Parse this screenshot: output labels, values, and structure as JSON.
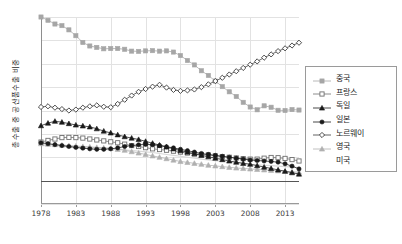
{
  "chart_data": {
    "type": "line",
    "title": "",
    "xlabel": "",
    "ylabel": "총수출 중 공산품수출 비중",
    "ylim": [
      -10,
      70
    ],
    "xlim": [
      1978,
      2015
    ],
    "ytick_labels": [
      "70%",
      "60%",
      "50%",
      "40%",
      "30%",
      "20%",
      "10%",
      "0%",
      "-10%"
    ],
    "ytick_values": [
      70,
      60,
      50,
      40,
      30,
      20,
      10,
      0,
      -10
    ],
    "xtick_labels": [
      "1978",
      "1983",
      "1988",
      "1993",
      "1998",
      "2003",
      "2008",
      "2013"
    ],
    "xtick_values": [
      1978,
      1983,
      1988,
      1993,
      1998,
      2003,
      2008,
      2013
    ],
    "grid": true,
    "legend_position": "right",
    "x": [
      1978,
      1979,
      1980,
      1981,
      1982,
      1983,
      1984,
      1985,
      1986,
      1987,
      1988,
      1989,
      1990,
      1991,
      1992,
      1993,
      1994,
      1995,
      1996,
      1997,
      1998,
      1999,
      2000,
      2001,
      2002,
      2003,
      2004,
      2005,
      2006,
      2007,
      2008,
      2009,
      2010,
      2011,
      2012,
      2013,
      2014,
      2015
    ],
    "series": [
      {
        "name": "중국",
        "marker": "filled-square",
        "color": "#a6a6a6",
        "values": [
          70.0,
          68.6,
          67.0,
          66.3,
          64.5,
          62.0,
          59.1,
          57.6,
          57.0,
          56.4,
          56.5,
          56.5,
          56.2,
          55.4,
          55.3,
          55.5,
          55.6,
          55.4,
          55.5,
          55.0,
          53.5,
          51.4,
          49.5,
          47.0,
          45.0,
          42.6,
          40.2,
          38.0,
          36.0,
          33.5,
          31.5,
          30.3,
          32.0,
          31.4,
          30.1,
          30.0,
          30.4,
          30.2
        ]
      },
      {
        "name": "프랑스",
        "marker": "open-square",
        "color": "#6e6e6e",
        "values": [
          16.5,
          17.2,
          17.8,
          18.4,
          18.5,
          18.4,
          18.2,
          17.8,
          17.4,
          17.0,
          16.6,
          16.2,
          15.6,
          15.0,
          14.6,
          14.1,
          13.6,
          13.3,
          13.0,
          12.6,
          12.2,
          11.8,
          11.4,
          11.2,
          11.0,
          10.6,
          10.3,
          10.0,
          9.7,
          9.4,
          9.2,
          9.2,
          9.6,
          9.9,
          9.8,
          9.5,
          9.0,
          8.4
        ]
      },
      {
        "name": "독일",
        "marker": "filled-triangle",
        "color": "#1a1a1a",
        "values": [
          23.5,
          24.6,
          25.4,
          25.0,
          24.4,
          23.8,
          23.4,
          23.0,
          22.2,
          21.2,
          20.4,
          19.6,
          18.8,
          18.2,
          17.6,
          16.8,
          16.0,
          15.2,
          14.4,
          13.6,
          12.8,
          12.2,
          11.5,
          10.8,
          10.2,
          9.6,
          9.0,
          8.4,
          7.9,
          7.4,
          7.0,
          6.4,
          5.8,
          5.2,
          4.6,
          4.0,
          3.4,
          2.8
        ]
      },
      {
        "name": "일본",
        "marker": "filled-circle",
        "color": "#1a1a1a",
        "values": [
          16.2,
          15.8,
          15.4,
          15.0,
          14.6,
          14.2,
          13.9,
          13.6,
          13.4,
          13.4,
          13.6,
          14.0,
          14.6,
          15.0,
          15.3,
          15.5,
          15.4,
          15.0,
          14.5,
          14.0,
          13.4,
          12.8,
          12.2,
          11.6,
          11.2,
          10.8,
          10.4,
          10.0,
          9.6,
          9.2,
          8.8,
          8.6,
          8.4,
          8.2,
          7.9,
          7.2,
          6.2,
          5.0
        ]
      },
      {
        "name": "노르웨이",
        "marker": "open-diamond",
        "color": "#3a3a3a",
        "values": [
          31.5,
          31.8,
          31.2,
          30.6,
          30.0,
          30.4,
          31.2,
          31.8,
          32.2,
          31.6,
          31.4,
          32.8,
          34.6,
          36.4,
          38.0,
          39.2,
          40.2,
          41.0,
          39.8,
          38.8,
          38.4,
          38.6,
          39.0,
          40.0,
          41.2,
          42.6,
          44.0,
          45.4,
          46.8,
          48.2,
          49.6,
          51.0,
          52.6,
          54.0,
          55.4,
          56.6,
          57.8,
          59.0
        ]
      },
      {
        "name": "영국",
        "marker": "filled-triangle-gray",
        "color": "#b0b0b0",
        "values": [
          15.8,
          15.6,
          15.4,
          15.2,
          15.0,
          14.8,
          14.6,
          14.4,
          14.2,
          14.0,
          13.8,
          13.4,
          13.0,
          12.4,
          11.8,
          11.2,
          10.6,
          10.0,
          9.4,
          8.8,
          8.2,
          7.8,
          7.4,
          7.0,
          6.6,
          6.3,
          6.0,
          5.7,
          5.4,
          5.2,
          5.0,
          4.8,
          4.6,
          4.4,
          4.2,
          4.0,
          3.8,
          3.6
        ]
      },
      {
        "name": "미국",
        "marker": "none",
        "color": "#d8d8d8",
        "values": [
          15.0,
          14.9,
          14.8,
          14.7,
          14.6,
          14.5,
          14.4,
          14.3,
          14.1,
          13.9,
          13.7,
          13.5,
          13.2,
          12.9,
          12.6,
          12.3,
          12.0,
          11.6,
          11.2,
          10.8,
          10.4,
          10.0,
          9.6,
          9.2,
          8.8,
          8.5,
          8.2,
          7.9,
          7.6,
          7.3,
          7.0,
          6.8,
          6.6,
          6.4,
          6.2,
          6.0,
          5.8,
          5.6
        ]
      }
    ]
  },
  "legend": {
    "items": [
      {
        "label": "중국"
      },
      {
        "label": "프랑스"
      },
      {
        "label": "독일"
      },
      {
        "label": "일본"
      },
      {
        "label": "노르웨이"
      },
      {
        "label": "영국"
      },
      {
        "label": "미국"
      }
    ]
  }
}
